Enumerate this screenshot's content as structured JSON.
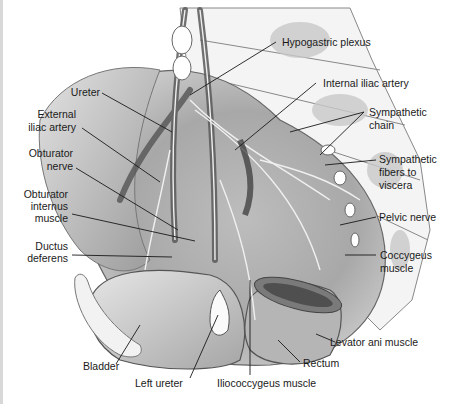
{
  "figure": {
    "background": "#ffffff",
    "line_color": "#1a1a1a"
  },
  "labels": {
    "hypogastric_plexus": "Hypogastric plexus",
    "internal_iliac_artery": "Internal iliac artery",
    "sympathetic_chain_1": "Sympathetic",
    "sympathetic_chain_2": "chain",
    "sympathetic_fibers_1": "Sympathetic",
    "sympathetic_fibers_2": "fibers to",
    "sympathetic_fibers_3": "viscera",
    "pelvic_nerve": "Pelvic nerve",
    "coccygeus_1": "Coccygeus",
    "coccygeus_2": "muscle",
    "levator_ani": "Levator ani muscle",
    "rectum": "Rectum",
    "iliococcygeus": "Iliococcygeus muscle",
    "left_ureter": "Left ureter",
    "bladder": "Bladder",
    "ductus_1": "Ductus",
    "ductus_2": "deferens",
    "obturator_internus_1": "Obturator",
    "obturator_internus_2": "internus",
    "obturator_internus_3": "muscle",
    "obturator_nerve_1": "Obturator",
    "obturator_nerve_2": "nerve",
    "external_iliac_1": "External",
    "external_iliac_2": "iliac artery",
    "ureter": "Ureter"
  }
}
